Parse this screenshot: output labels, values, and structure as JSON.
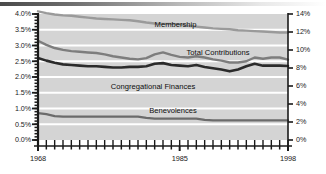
{
  "chart_data": {
    "type": "line",
    "title": "",
    "xlabel": "",
    "ylabel": "",
    "grid": true,
    "legend_position": "inline-labels",
    "x": [
      1968,
      1969,
      1970,
      1971,
      1972,
      1973,
      1974,
      1975,
      1976,
      1977,
      1978,
      1979,
      1980,
      1981,
      1982,
      1983,
      1984,
      1985,
      1986,
      1987,
      1988,
      1989,
      1990,
      1991,
      1992,
      1993,
      1994,
      1995,
      1996,
      1997,
      1998
    ],
    "x_axis": {
      "min": 1968,
      "max": 1998,
      "tick_interval": 1,
      "labeled_ticks": [
        "1968",
        "1985",
        "1998"
      ]
    },
    "left_axis": {
      "label": "",
      "min": 0.0,
      "max": 4.0,
      "tick_interval": 0.5,
      "tick_labels": [
        "4.0%",
        "3.5%",
        "3.0%",
        "2.5%",
        "2.0%",
        "1.5%",
        "1.0%",
        "0.5%",
        "0.0%"
      ],
      "unit": "percent of income"
    },
    "right_axis": {
      "label": "",
      "min": 0,
      "max": 14,
      "tick_interval": 2,
      "tick_labels": [
        "14%",
        "12%",
        "10%",
        "8%",
        "6%",
        "4%",
        "2%",
        "0%"
      ],
      "unit": "percent of population"
    },
    "series": [
      {
        "name": "Membership",
        "axis": "right",
        "color": "#9a9a9a",
        "values": [
          14.3,
          14.1,
          13.95,
          13.85,
          13.8,
          13.7,
          13.6,
          13.5,
          13.45,
          13.4,
          13.35,
          13.3,
          13.2,
          13.05,
          12.95,
          12.9,
          12.9,
          12.85,
          12.7,
          12.6,
          12.5,
          12.4,
          12.35,
          12.3,
          12.2,
          12.15,
          12.1,
          12.05,
          12.0,
          11.95,
          11.95
        ]
      },
      {
        "name": "Total Contributions",
        "axis": "left",
        "color": "#7d7d7d",
        "values": [
          3.15,
          3.02,
          2.92,
          2.86,
          2.82,
          2.8,
          2.78,
          2.76,
          2.72,
          2.66,
          2.62,
          2.58,
          2.56,
          2.6,
          2.72,
          2.78,
          2.7,
          2.64,
          2.62,
          2.66,
          2.62,
          2.56,
          2.52,
          2.46,
          2.46,
          2.5,
          2.62,
          2.58,
          2.62,
          2.62,
          2.55
        ]
      },
      {
        "name": "Congregational Finances",
        "axis": "left",
        "color": "#2b2b2b",
        "values": [
          2.6,
          2.52,
          2.45,
          2.4,
          2.38,
          2.36,
          2.34,
          2.34,
          2.32,
          2.3,
          2.3,
          2.32,
          2.32,
          2.34,
          2.42,
          2.44,
          2.38,
          2.36,
          2.34,
          2.38,
          2.32,
          2.28,
          2.24,
          2.18,
          2.24,
          2.34,
          2.42,
          2.36,
          2.36,
          2.36,
          2.35
        ]
      },
      {
        "name": "Benevolences",
        "axis": "left",
        "color": "#6b6b6b",
        "values": [
          0.85,
          0.82,
          0.76,
          0.74,
          0.74,
          0.74,
          0.74,
          0.74,
          0.74,
          0.74,
          0.74,
          0.74,
          0.74,
          0.7,
          0.68,
          0.68,
          0.68,
          0.68,
          0.68,
          0.68,
          0.64,
          0.62,
          0.62,
          0.62,
          0.62,
          0.62,
          0.62,
          0.62,
          0.62,
          0.62,
          0.62
        ]
      }
    ],
    "inline_labels": [
      {
        "text": "Membership",
        "x_pct": 55,
        "y_pct": 8
      },
      {
        "text": "Total Contributions",
        "x_pct": 72,
        "y_pct": 30
      },
      {
        "text": "Congregational Finances",
        "x_pct": 46,
        "y_pct": 57
      },
      {
        "text": "Benevolences",
        "x_pct": 54,
        "y_pct": 76
      }
    ],
    "colors": {
      "plot_background": "#d4d4d4",
      "gridline": "#ffffff",
      "axis": "#1a1a1a",
      "top_rule": "#4a4a4a"
    }
  }
}
